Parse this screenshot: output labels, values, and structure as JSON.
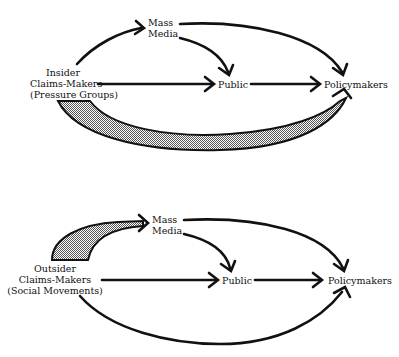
{
  "colors": {
    "ink": "#111111",
    "band_fill": "#b8b8b8",
    "background": "#ffffff"
  },
  "panels": [
    {
      "id": "insider",
      "source": {
        "lines": [
          "Insider",
          "Claims-Makers",
          "(Pressure Groups)"
        ]
      },
      "media": {
        "lines": [
          "Mass",
          "Media"
        ]
      },
      "public": "Public",
      "policymakers": "Policymakers",
      "edges": [
        {
          "from": "source",
          "to": "media",
          "style": "arrow"
        },
        {
          "from": "source",
          "to": "public",
          "style": "arrow"
        },
        {
          "from": "media",
          "to": "public",
          "style": "arrow"
        },
        {
          "from": "media",
          "to": "policymakers",
          "style": "arrow"
        },
        {
          "from": "public",
          "to": "policymakers",
          "style": "arrow"
        },
        {
          "from": "source",
          "to": "policymakers",
          "style": "thick-shaded"
        }
      ]
    },
    {
      "id": "outsider",
      "source": {
        "lines": [
          "Outsider",
          "Claims-Makers",
          "(Social Movements)"
        ]
      },
      "media": {
        "lines": [
          "Mass",
          "Media"
        ]
      },
      "public": "Public",
      "policymakers": "Policymakers",
      "edges": [
        {
          "from": "source",
          "to": "media",
          "style": "thick-shaded"
        },
        {
          "from": "source",
          "to": "public",
          "style": "arrow"
        },
        {
          "from": "media",
          "to": "public",
          "style": "arrow"
        },
        {
          "from": "media",
          "to": "policymakers",
          "style": "arrow"
        },
        {
          "from": "public",
          "to": "policymakers",
          "style": "arrow"
        },
        {
          "from": "source",
          "to": "policymakers",
          "style": "arrow"
        }
      ]
    }
  ]
}
